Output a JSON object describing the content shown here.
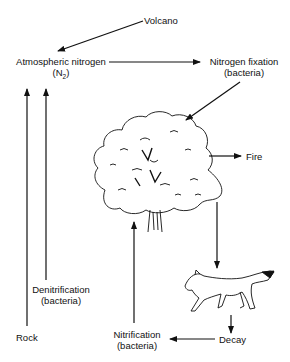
{
  "diagram": {
    "nodes": {
      "volcano": {
        "label": "Volcano"
      },
      "atmospheric_nitrogen": {
        "label": "Atmospheric nitrogen",
        "sub_prefix": "(N",
        "sub_index": "2",
        "sub_suffix": ")"
      },
      "nitrogen_fixation": {
        "label": "Nitrogen fixation",
        "sub": "(bacteria)"
      },
      "fire": {
        "label": "Fire"
      },
      "denitrification": {
        "label": "Denitrification",
        "sub": "(bacteria)"
      },
      "rock": {
        "label": "Rock"
      },
      "nitrification": {
        "label": "Nitrification",
        "sub": "(bacteria)"
      },
      "decay": {
        "label": "Decay"
      },
      "tree": {
        "icon": "tree-illustration"
      },
      "animal": {
        "icon": "coyote-illustration"
      }
    },
    "edges": [
      {
        "from": "Volcano",
        "to": "Atmospheric nitrogen"
      },
      {
        "from": "Atmospheric nitrogen",
        "to": "Nitrogen fixation"
      },
      {
        "from": "Nitrogen fixation",
        "to": "Tree"
      },
      {
        "from": "Tree",
        "to": "Fire"
      },
      {
        "from": "Tree",
        "to": "Animal"
      },
      {
        "from": "Animal",
        "to": "Decay"
      },
      {
        "from": "Decay",
        "to": "Nitrification"
      },
      {
        "from": "Nitrification",
        "to": "Tree"
      },
      {
        "from": "Denitrification",
        "to": "Atmospheric nitrogen"
      },
      {
        "from": "Rock",
        "to": "Atmospheric nitrogen"
      }
    ]
  }
}
